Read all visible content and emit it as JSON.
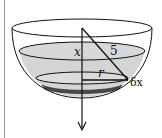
{
  "diagram": {
    "labels": {
      "depth": "x",
      "bowl_radius": "5",
      "slice_radius": "r",
      "slice_thickness": "δx"
    },
    "colors": {
      "liquid": "#d4d4d4",
      "slice": "#555555",
      "stroke": "#111111"
    }
  }
}
